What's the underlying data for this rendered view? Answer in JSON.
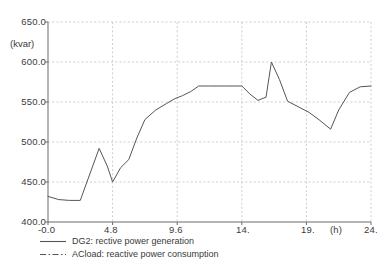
{
  "chart_data": {
    "type": "line",
    "title": "",
    "subtitle": "",
    "xlabel": "(h)",
    "ylabel": "(kvar)",
    "unit_label": "(kvar)",
    "xlim": [
      0,
      24
    ],
    "ylim": [
      400.0,
      650.0
    ],
    "grid": true,
    "legend_position": "bottom-left",
    "yticks": [
      400.0,
      450.0,
      500.0,
      550.0,
      600.0,
      650.0
    ],
    "ytick_labels": [
      "400.0",
      "450.0",
      "500.0",
      "550.0",
      "600.0",
      "650.0"
    ],
    "xticks": [
      0,
      4.8,
      9.6,
      14.4,
      19.2,
      24.0
    ],
    "xtick_labels": [
      "-0.0",
      "4.8",
      "9.6",
      "14.",
      "19.",
      "24."
    ],
    "series": [
      {
        "name": "DG2: rective power generation",
        "style": "solid",
        "color": "#555555",
        "x": [
          0.0,
          0.8,
          1.6,
          2.4,
          3.0,
          3.8,
          4.4,
          4.8,
          5.4,
          6.0,
          6.6,
          7.2,
          8.0,
          8.8,
          9.4,
          10.0,
          10.6,
          11.2,
          12.0,
          13.2,
          14.4,
          15.0,
          15.6,
          16.2,
          16.6,
          17.2,
          17.8,
          18.6,
          19.4,
          20.2,
          21.0,
          21.6,
          22.4,
          23.2,
          24.0
        ],
        "y": [
          432,
          428,
          427,
          427,
          455,
          492,
          470,
          450,
          468,
          478,
          505,
          528,
          540,
          548,
          554,
          558,
          563,
          570,
          570,
          570,
          570,
          560,
          552,
          556,
          600,
          578,
          551,
          544,
          537,
          527,
          516,
          540,
          562,
          569,
          570
        ]
      },
      {
        "name": "ACload: reactive power consumption",
        "style": "dash-dot",
        "color": "#555555",
        "x": [],
        "y": []
      }
    ]
  },
  "legend": {
    "items": [
      {
        "label": "DG2: rective power generation",
        "style": "solid"
      },
      {
        "label": "ACload: reactive power consumption",
        "style": "dash-dot"
      }
    ]
  },
  "colors": {
    "axis": "#6b6b6b",
    "grid": "#b9b9b9",
    "line": "#555555",
    "text": "#3a3a3a",
    "background": "#ffffff"
  }
}
